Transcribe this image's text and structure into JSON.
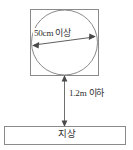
{
  "diagram": {
    "colors": {
      "stroke": "#8a8a8a",
      "arrow": "#6f6f6f",
      "text": "#2e2e2e",
      "background": "#ffffff"
    },
    "fixture": {
      "name": "square-fixture",
      "shape": "square-with-inscribed-circle"
    },
    "labels": {
      "diameter": "50cm 이상",
      "height": "1.2m 이하",
      "ground": "지상"
    },
    "icons": {
      "diameter_arrow": "double-headed-arrow-icon",
      "height_arrow": "double-headed-arrow-icon"
    },
    "measurements": [
      {
        "label": "50cm 이상",
        "value": "50cm",
        "qualifier": "이상",
        "applies_to": "circle-diameter"
      },
      {
        "label": "1.2m 이하",
        "value": "1.2m",
        "qualifier": "이하",
        "applies_to": "height-above-ground"
      }
    ]
  }
}
